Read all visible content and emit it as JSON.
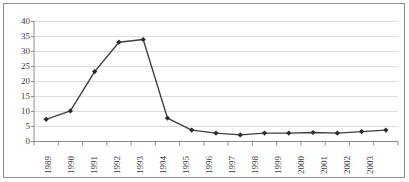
{
  "chart_data": {
    "type": "line",
    "title": "",
    "subtitle": "",
    "xlabel": "",
    "ylabel": "",
    "categories": [
      "1989",
      "1990",
      "1991",
      "1992",
      "1993",
      "1994",
      "1995",
      "1996",
      "1997",
      "1998",
      "1999",
      "2000",
      "2001",
      "2002",
      "2003"
    ],
    "values": [
      7.4,
      10.2,
      23.3,
      33.1,
      34.0,
      7.8,
      3.8,
      2.8,
      2.2,
      2.8,
      2.8,
      3.0,
      2.8,
      3.3,
      3.8
    ],
    "series": [
      {
        "name": "series-1",
        "values": [
          7.4,
          10.2,
          23.3,
          33.1,
          34.0,
          7.8,
          3.8,
          2.8,
          2.2,
          2.8,
          2.8,
          3.0,
          2.8,
          3.3,
          3.8
        ]
      }
    ],
    "ylim": [
      0,
      40
    ],
    "yticks": [
      0,
      5,
      10,
      15,
      20,
      25,
      30,
      35,
      40
    ],
    "ytick_labels": [
      "0",
      "5",
      "10",
      "15",
      "20",
      "25",
      "30",
      "35",
      "40"
    ],
    "grid": "horizontal",
    "legend": "none",
    "marker": "diamond",
    "colors": {
      "line": "#3f3f3f",
      "marker": "#2b2b2b",
      "gridline": "#d3d3d3",
      "axis": "#808080",
      "frame": "#8d8d8d",
      "plot_background": "#ffffff",
      "text": "#3a3a3a"
    }
  }
}
